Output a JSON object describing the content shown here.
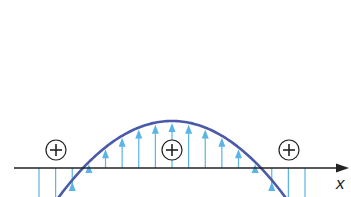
{
  "diagram": {
    "axis_label": "x",
    "colors": {
      "curve": "#4a5aa8",
      "arrows": "#5ab4e6",
      "axis": "#222222",
      "charge_symbol": "#222222"
    },
    "curve": {
      "type": "parabola",
      "vertex": [
        172,
        121
      ],
      "k": 0.00594,
      "x_range": [
        35,
        309
      ]
    },
    "arrows": {
      "count": 17,
      "x_start": 39,
      "spacing": 16.625,
      "base_y": 168,
      "direction": "up"
    },
    "charges": [
      {
        "symbol": "+",
        "cx": 56,
        "cy": 150
      },
      {
        "symbol": "+",
        "cx": 172,
        "cy": 150
      },
      {
        "symbol": "+",
        "cx": 289,
        "cy": 150
      }
    ]
  }
}
